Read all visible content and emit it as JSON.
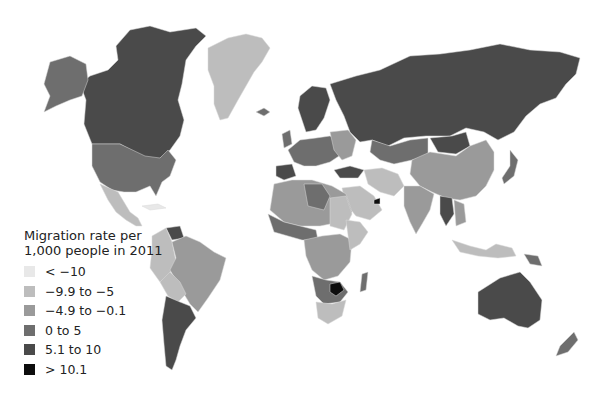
{
  "map": {
    "title": "Migration rate per 1,000 people in 2011",
    "type": "choropleth",
    "region": "World"
  },
  "legend": {
    "title_line1": "Migration rate per",
    "title_line2": "1,000 people in 2011",
    "items": [
      {
        "label": "< −10",
        "color": "#e8e8e8"
      },
      {
        "label": "−9.9 to −5",
        "color": "#bdbdbd"
      },
      {
        "label": "−4.9 to −0.1",
        "color": "#9a9a9a"
      },
      {
        "label": "0 to 5",
        "color": "#6e6e6e"
      },
      {
        "label": "5.1 to 10",
        "color": "#4a4a4a"
      },
      {
        "label": "> 10.1",
        "color": "#0d0d0d"
      }
    ]
  },
  "regions": [
    {
      "name": "Canada",
      "class": "5.1 to 10"
    },
    {
      "name": "Alaska",
      "class": "0 to 5"
    },
    {
      "name": "United States",
      "class": "0 to 5"
    },
    {
      "name": "Greenland",
      "class": "−9.9 to −5"
    },
    {
      "name": "Mexico",
      "class": "−9.9 to −5"
    },
    {
      "name": "Brazil",
      "class": "−4.9 to −0.1"
    },
    {
      "name": "Argentina",
      "class": "5.1 to 10"
    },
    {
      "name": "Venezuela",
      "class": "5.1 to 10"
    },
    {
      "name": "Russia",
      "class": "5.1 to 10"
    },
    {
      "name": "China",
      "class": "−4.9 to −0.1"
    },
    {
      "name": "India",
      "class": "−4.9 to −0.1"
    },
    {
      "name": "Australia",
      "class": "5.1 to 10"
    },
    {
      "name": "Zimbabwe",
      "class": "> 10.1"
    },
    {
      "name": "United Arab Emirates",
      "class": "> 10.1"
    }
  ]
}
